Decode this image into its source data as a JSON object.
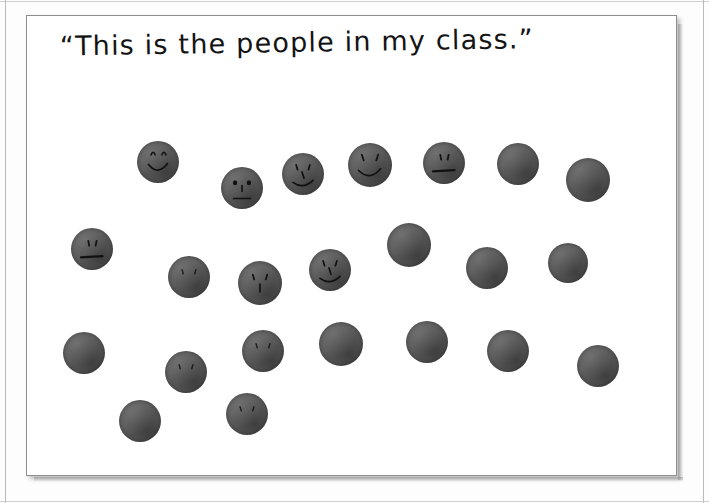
{
  "image": {
    "kind": "scanned-photograph",
    "caption": "“This is the people in my class.”",
    "caption_style": "handwritten-marker",
    "paper_color": "#ffffff",
    "background_color": "#fdfdfd",
    "dot_color": "#5a5a5a",
    "ink_color": "#141414",
    "dot_count": 21,
    "faces_drawn": 11,
    "dots": [
      {
        "id": "dot-1",
        "x": 158,
        "y": 162,
        "r": 21,
        "face": "smile"
      },
      {
        "id": "dot-2",
        "x": 242,
        "y": 188,
        "r": 21,
        "face": "eyes-nose-line"
      },
      {
        "id": "dot-3",
        "x": 303,
        "y": 174,
        "r": 21,
        "face": "eyes-nose-smile"
      },
      {
        "id": "dot-4",
        "x": 370,
        "y": 165,
        "r": 22,
        "face": "eyes-smile"
      },
      {
        "id": "dot-5",
        "x": 444,
        "y": 163,
        "r": 21,
        "face": "line-mouth"
      },
      {
        "id": "dot-6",
        "x": 518,
        "y": 164,
        "r": 21,
        "face": "none"
      },
      {
        "id": "dot-7",
        "x": 588,
        "y": 180,
        "r": 22,
        "face": "none"
      },
      {
        "id": "dot-8",
        "x": 92,
        "y": 249,
        "r": 21,
        "face": "line-mouth"
      },
      {
        "id": "dot-9",
        "x": 189,
        "y": 277,
        "r": 21,
        "face": "eyes-faint"
      },
      {
        "id": "dot-10",
        "x": 260,
        "y": 283,
        "r": 22,
        "face": "eyes-nose"
      },
      {
        "id": "dot-11",
        "x": 330,
        "y": 270,
        "r": 21,
        "face": "eyes-nose-smile"
      },
      {
        "id": "dot-12",
        "x": 409,
        "y": 245,
        "r": 22,
        "face": "none"
      },
      {
        "id": "dot-13",
        "x": 487,
        "y": 268,
        "r": 21,
        "face": "none"
      },
      {
        "id": "dot-14",
        "x": 568,
        "y": 263,
        "r": 20,
        "face": "none"
      },
      {
        "id": "dot-15",
        "x": 84,
        "y": 353,
        "r": 21,
        "face": "none"
      },
      {
        "id": "dot-16",
        "x": 186,
        "y": 372,
        "r": 21,
        "face": "eyes-faint"
      },
      {
        "id": "dot-17",
        "x": 263,
        "y": 351,
        "r": 21,
        "face": "eyes-faint"
      },
      {
        "id": "dot-18",
        "x": 341,
        "y": 344,
        "r": 22,
        "face": "none"
      },
      {
        "id": "dot-19",
        "x": 427,
        "y": 342,
        "r": 21,
        "face": "none"
      },
      {
        "id": "dot-20",
        "x": 508,
        "y": 351,
        "r": 21,
        "face": "none"
      },
      {
        "id": "dot-21",
        "x": 598,
        "y": 366,
        "r": 21,
        "face": "none"
      },
      {
        "id": "dot-22",
        "x": 140,
        "y": 421,
        "r": 21,
        "face": "none"
      },
      {
        "id": "dot-23",
        "x": 247,
        "y": 414,
        "r": 21,
        "face": "eyes-faint"
      }
    ]
  }
}
